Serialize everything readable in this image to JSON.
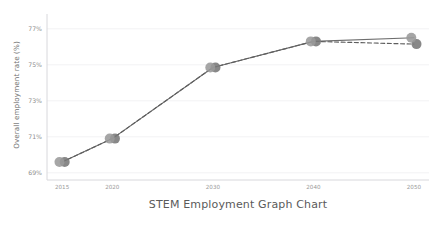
{
  "chart_data": {
    "type": "line",
    "title": "STEM Employment Graph Chart",
    "title_position": "bottom",
    "xlabel": "",
    "ylabel": "Overall employment rate (%)",
    "x": [
      2015,
      2020,
      2030,
      2040,
      2050
    ],
    "xtick_labels": [
      "2015",
      "2020",
      "2030",
      "2040",
      "2050"
    ],
    "ytick_labels": [
      "69%",
      "71%",
      "73%",
      "75%",
      "77%"
    ],
    "ytick_values": [
      69,
      71,
      73,
      75,
      77
    ],
    "xlim": [
      2013.5,
      2051.5
    ],
    "ylim": [
      68.6,
      77.6
    ],
    "grid": true,
    "grid_axis": "y",
    "legend": "none",
    "series": [
      {
        "name": "solid-series",
        "style": "solid",
        "color": "#6e6e6e",
        "marker": "circle",
        "marker_color": "#9a9a9a",
        "values": [
          69.6,
          70.9,
          74.85,
          76.3,
          76.5
        ]
      },
      {
        "name": "dashed-series",
        "style": "dashed",
        "color": "#5e5e5e",
        "marker": "circle",
        "marker_color": "#777777",
        "values": [
          69.6,
          70.9,
          74.85,
          76.3,
          76.15
        ]
      }
    ]
  },
  "colors": {
    "background": "#ffffff",
    "grid": "#f2f2f4",
    "spine": "#d8d8dc",
    "tick_text": "#9a9a9a",
    "axis_label_text": "#6f6f6f",
    "title_text": "#5a5a5a",
    "line_primary": "#6e6e6e",
    "line_secondary": "#5e5e5e",
    "marker_light": "#9a9a9a",
    "marker_dark": "#6f6f6f"
  }
}
